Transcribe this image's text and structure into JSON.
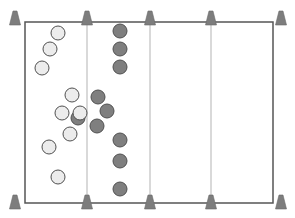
{
  "diagram": {
    "type": "sports-drill-field",
    "colors": {
      "background": "#ffffff",
      "field_border": "#555555",
      "zone_line": "#cccccc",
      "cone": "#7d7d7d",
      "team_light_fill": "#ececec",
      "team_dark_fill": "#7f7f7f",
      "player_stroke": "#505050"
    },
    "field": {
      "x": 25,
      "y": 22,
      "width": 248,
      "height": 181
    },
    "zone_lines_x": [
      87,
      150,
      211
    ],
    "cones": [
      {
        "x": 15,
        "y": 20
      },
      {
        "x": 87,
        "y": 20
      },
      {
        "x": 150,
        "y": 20
      },
      {
        "x": 211,
        "y": 20
      },
      {
        "x": 281,
        "y": 20
      },
      {
        "x": 15,
        "y": 204
      },
      {
        "x": 87,
        "y": 204
      },
      {
        "x": 150,
        "y": 204
      },
      {
        "x": 211,
        "y": 204
      },
      {
        "x": 281,
        "y": 204
      }
    ],
    "team_dark": [
      {
        "x": 120,
        "y": 31
      },
      {
        "x": 120,
        "y": 49
      },
      {
        "x": 120,
        "y": 67
      },
      {
        "x": 78,
        "y": 118
      },
      {
        "x": 98,
        "y": 97
      },
      {
        "x": 107,
        "y": 111
      },
      {
        "x": 97,
        "y": 126
      },
      {
        "x": 120,
        "y": 140
      },
      {
        "x": 120,
        "y": 161
      },
      {
        "x": 120,
        "y": 189
      }
    ],
    "team_light": [
      {
        "x": 58,
        "y": 33
      },
      {
        "x": 50,
        "y": 49
      },
      {
        "x": 42,
        "y": 68
      },
      {
        "x": 72,
        "y": 95
      },
      {
        "x": 62,
        "y": 113
      },
      {
        "x": 80,
        "y": 113
      },
      {
        "x": 70,
        "y": 134
      },
      {
        "x": 49,
        "y": 147
      },
      {
        "x": 58,
        "y": 177
      }
    ],
    "player_radius": 7
  }
}
